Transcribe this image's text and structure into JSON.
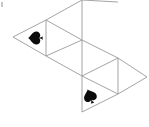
{
  "figure": {
    "background_color": "#ffffff",
    "line_color": "#9a9a9a",
    "glyph_color": "#0c0c0c",
    "width": 149,
    "height": 127
  },
  "chart_data": {
    "type": "diagram",
    "xlabel": "",
    "ylabel": "",
    "vertices": [
      {
        "id": "A",
        "x": 13,
        "y": 37
      },
      {
        "id": "B",
        "x": 46,
        "y": 20
      },
      {
        "id": "C",
        "x": 46,
        "y": 56
      },
      {
        "id": "D",
        "x": 82,
        "y": 0
      },
      {
        "id": "E",
        "x": 82,
        "y": 40
      },
      {
        "id": "F",
        "x": 82,
        "y": 76
      },
      {
        "id": "G",
        "x": 118,
        "y": 58
      },
      {
        "id": "H",
        "x": 118,
        "y": 94
      },
      {
        "id": "I",
        "x": 147,
        "y": 77
      },
      {
        "id": "J",
        "x": 82,
        "y": 112
      },
      {
        "id": "K",
        "x": 118,
        "y": 2
      }
    ],
    "edges": [
      {
        "from": "A",
        "to": "B"
      },
      {
        "from": "A",
        "to": "C"
      },
      {
        "from": "B",
        "to": "C"
      },
      {
        "from": "B",
        "to": "D"
      },
      {
        "from": "B",
        "to": "E"
      },
      {
        "from": "C",
        "to": "E"
      },
      {
        "from": "C",
        "to": "F"
      },
      {
        "from": "D",
        "to": "E"
      },
      {
        "from": "D",
        "to": "K"
      },
      {
        "from": "E",
        "to": "F"
      },
      {
        "from": "E",
        "to": "G"
      },
      {
        "from": "F",
        "to": "G"
      },
      {
        "from": "F",
        "to": "H"
      },
      {
        "from": "F",
        "to": "J"
      },
      {
        "from": "G",
        "to": "H"
      },
      {
        "from": "G",
        "to": "I"
      },
      {
        "from": "H",
        "to": "I"
      },
      {
        "from": "H",
        "to": "J"
      }
    ],
    "markers": [
      {
        "id": "marker-left",
        "symbol": "spade",
        "cx": 35,
        "cy": 38,
        "size": 15,
        "rotation": -90
      },
      {
        "id": "marker-bottom",
        "symbol": "spade",
        "cx": 90,
        "cy": 96,
        "size": 15,
        "rotation": -20
      }
    ],
    "grid": false,
    "legend": false
  },
  "annotations": {
    "corner_speck_label": "stray-mark"
  }
}
